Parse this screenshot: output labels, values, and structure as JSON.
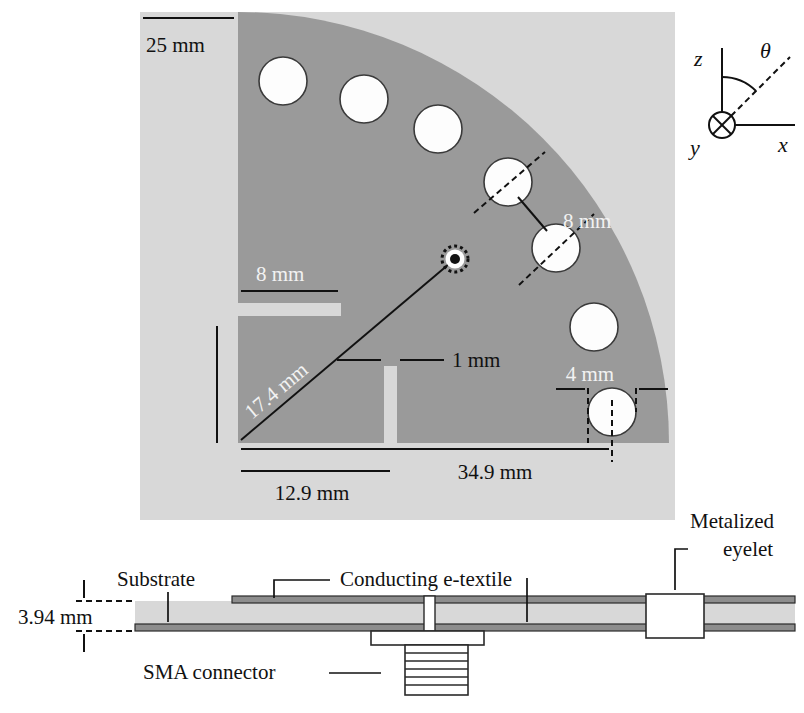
{
  "figure": {
    "colors": {
      "substrate": "#d8d8d8",
      "etextile": "#9a9a9a",
      "eyelet_fill": "#fdfdfd",
      "outline": "#111111",
      "white_text": "#f2f2f2",
      "background": "#ffffff"
    }
  },
  "top_view": {
    "name": "top-view",
    "dimensions": {
      "substrate_margin": "25 mm",
      "slot_horizontal_length": "8 mm",
      "eyelet_spacing": "8 mm",
      "feed_offset_diagonal": "17.4 mm",
      "slot_width": "1 mm",
      "eyelet_diameter": "4 mm",
      "feed_offset_x": "12.9 mm",
      "radius": "34.9 mm"
    },
    "axes": {
      "z_label": "z",
      "x_label": "x",
      "y_label": "y",
      "theta_label": "θ"
    }
  },
  "side_view": {
    "name": "side-view",
    "thickness": "3.94 mm",
    "labels": {
      "substrate": "Substrate",
      "conducting_etextile": "Conducting e-textile",
      "sma_connector": "SMA connector",
      "metalized_eyelet_line1": "Metalized",
      "metalized_eyelet_line2": "eyelet"
    }
  }
}
